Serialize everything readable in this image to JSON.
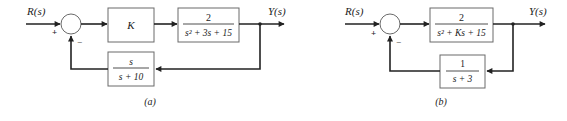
{
  "diagram_a": {
    "caption": "(a)",
    "input_label": "R(s)",
    "output_label": "Y(s)",
    "sum_plus": "+",
    "sum_minus": "−",
    "forward_block_1": "K",
    "forward_block_2": {
      "numerator": "2",
      "denominator": "s² + 3s + 15"
    },
    "feedback_block": {
      "numerator": "s",
      "denominator": "s + 10"
    }
  },
  "diagram_b": {
    "caption": "(b)",
    "input_label": "R(s)",
    "output_label": "Y(s)",
    "sum_plus": "+",
    "sum_minus": "−",
    "forward_block": {
      "numerator": "2",
      "denominator": "s² + Ks + 15"
    },
    "feedback_block": {
      "numerator": "1",
      "denominator": "s + 3"
    }
  }
}
